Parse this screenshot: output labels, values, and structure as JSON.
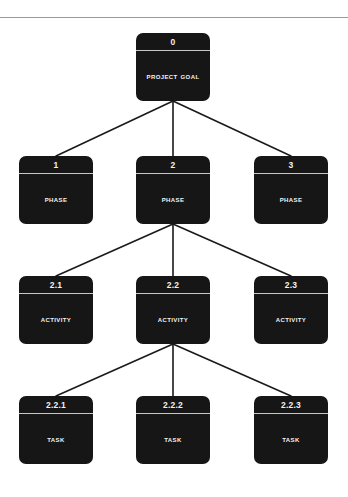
{
  "diagram": {
    "type": "tree",
    "background_color": "#ffffff",
    "node_fill_color": "#161616",
    "node_text_color": "#f4f4f4",
    "edge_color": "#1a1a1a",
    "rule_color": "#9a9a9a",
    "levels": [
      {
        "name": "goal",
        "label": "Project Goal"
      },
      {
        "name": "phase",
        "label": "Phase"
      },
      {
        "name": "activity",
        "label": "Activity"
      },
      {
        "name": "task",
        "label": "Task"
      }
    ],
    "nodes": [
      {
        "id": "n0",
        "code": "0",
        "label": "Project Goal",
        "level": "goal",
        "x": 136,
        "y": 33,
        "w": 74,
        "h": 68
      },
      {
        "id": "n1",
        "code": "1",
        "label": "Phase",
        "level": "phase",
        "x": 19,
        "y": 156,
        "w": 74,
        "h": 68
      },
      {
        "id": "n2",
        "code": "2",
        "label": "Phase",
        "level": "phase",
        "x": 136,
        "y": 156,
        "w": 74,
        "h": 68
      },
      {
        "id": "n3",
        "code": "3",
        "label": "Phase",
        "level": "phase",
        "x": 254,
        "y": 156,
        "w": 74,
        "h": 68
      },
      {
        "id": "n21",
        "code": "2.1",
        "label": "Activity",
        "level": "activity",
        "x": 19,
        "y": 276,
        "w": 74,
        "h": 68
      },
      {
        "id": "n22",
        "code": "2.2",
        "label": "Activity",
        "level": "activity",
        "x": 136,
        "y": 276,
        "w": 74,
        "h": 68
      },
      {
        "id": "n23",
        "code": "2.3",
        "label": "Activity",
        "level": "activity",
        "x": 254,
        "y": 276,
        "w": 74,
        "h": 68
      },
      {
        "id": "n221",
        "code": "2.2.1",
        "label": "Task",
        "level": "task",
        "x": 19,
        "y": 396,
        "w": 74,
        "h": 68
      },
      {
        "id": "n222",
        "code": "2.2.2",
        "label": "Task",
        "level": "task",
        "x": 136,
        "y": 396,
        "w": 74,
        "h": 68
      },
      {
        "id": "n223",
        "code": "2.2.3",
        "label": "Task",
        "level": "task",
        "x": 254,
        "y": 396,
        "w": 74,
        "h": 68
      }
    ],
    "edges": [
      {
        "from": "n0",
        "to": "n1"
      },
      {
        "from": "n0",
        "to": "n2"
      },
      {
        "from": "n0",
        "to": "n3"
      },
      {
        "from": "n2",
        "to": "n21"
      },
      {
        "from": "n2",
        "to": "n22"
      },
      {
        "from": "n2",
        "to": "n23"
      },
      {
        "from": "n22",
        "to": "n221"
      },
      {
        "from": "n22",
        "to": "n222"
      },
      {
        "from": "n22",
        "to": "n223"
      }
    ]
  }
}
